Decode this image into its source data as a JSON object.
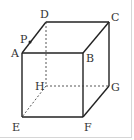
{
  "figure": {
    "type": "cube",
    "colors": {
      "line": "#222222",
      "hidden_line": "#444444",
      "label": "#333333",
      "frame": "#d6d6d6"
    },
    "vertices": {
      "A": {
        "x": 22,
        "y": 53
      },
      "B": {
        "x": 83,
        "y": 53
      },
      "C": {
        "x": 109,
        "y": 22
      },
      "D": {
        "x": 46,
        "y": 22
      },
      "E": {
        "x": 22,
        "y": 117
      },
      "F": {
        "x": 83,
        "y": 117
      },
      "G": {
        "x": 109,
        "y": 86
      },
      "H": {
        "x": 46,
        "y": 86
      },
      "P": {
        "x": 30,
        "y": 42
      }
    },
    "labels": {
      "A": "A",
      "B": "B",
      "C": "C",
      "D": "D",
      "E": "E",
      "F": "F",
      "G": "G",
      "H": "H",
      "P": "P"
    },
    "visible_edges": [
      "AB",
      "BC",
      "CD",
      "DA",
      "AE",
      "BF",
      "CG",
      "EF",
      "FG"
    ],
    "hidden_edges": [
      "DH",
      "HE",
      "HG"
    ],
    "points": [
      "P on edge AD"
    ]
  }
}
